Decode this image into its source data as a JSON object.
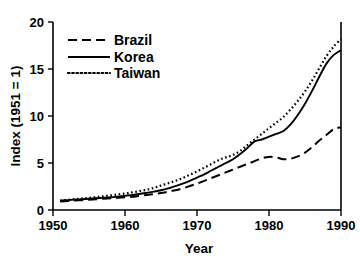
{
  "chart_data": {
    "type": "line",
    "title": "",
    "xlabel": "Year",
    "ylabel": "Index (1951 = 1)",
    "xlim": [
      1950,
      1990
    ],
    "ylim": [
      0,
      20
    ],
    "xticks": [
      1950,
      1960,
      1970,
      1980,
      1990
    ],
    "yticks": [
      0,
      5,
      10,
      15,
      20
    ],
    "grid": false,
    "legend_position": "upper left",
    "x": [
      1951,
      1952,
      1953,
      1954,
      1955,
      1956,
      1957,
      1958,
      1959,
      1960,
      1961,
      1962,
      1963,
      1964,
      1965,
      1966,
      1967,
      1968,
      1969,
      1970,
      1971,
      1972,
      1973,
      1974,
      1975,
      1976,
      1977,
      1978,
      1979,
      1980,
      1981,
      1982,
      1983,
      1984,
      1985,
      1986,
      1987,
      1988,
      1989,
      1990
    ],
    "series": [
      {
        "name": "Brazil",
        "style": "dashed",
        "color": "#000000",
        "values": [
          0.9,
          0.95,
          1.0,
          1.05,
          1.1,
          1.15,
          1.2,
          1.25,
          1.3,
          1.35,
          1.4,
          1.5,
          1.6,
          1.7,
          1.8,
          1.95,
          2.1,
          2.3,
          2.55,
          2.8,
          3.1,
          3.4,
          3.7,
          4.0,
          4.3,
          4.6,
          4.9,
          5.2,
          5.5,
          5.65,
          5.6,
          5.4,
          5.45,
          5.7,
          6.1,
          6.7,
          7.4,
          8.0,
          8.6,
          8.8
        ]
      },
      {
        "name": "Korea",
        "style": "solid",
        "color": "#000000",
        "values": [
          1.0,
          1.05,
          1.1,
          1.15,
          1.2,
          1.25,
          1.3,
          1.35,
          1.42,
          1.5,
          1.6,
          1.7,
          1.82,
          1.95,
          2.1,
          2.3,
          2.55,
          2.8,
          3.1,
          3.45,
          3.8,
          4.2,
          4.6,
          5.0,
          5.4,
          5.95,
          6.6,
          7.3,
          7.5,
          7.8,
          8.1,
          8.4,
          9.1,
          10.1,
          11.3,
          12.7,
          14.2,
          15.6,
          16.5,
          17.0
        ]
      },
      {
        "name": "Taiwan",
        "style": "dotted",
        "color": "#000000",
        "values": [
          1.0,
          1.08,
          1.15,
          1.22,
          1.3,
          1.38,
          1.46,
          1.55,
          1.65,
          1.75,
          1.88,
          2.0,
          2.15,
          2.35,
          2.6,
          2.85,
          3.1,
          3.4,
          3.75,
          4.1,
          4.5,
          4.9,
          5.3,
          5.6,
          5.85,
          6.3,
          6.9,
          7.5,
          8.1,
          8.7,
          9.3,
          9.9,
          10.7,
          11.6,
          12.6,
          13.8,
          15.1,
          16.4,
          17.4,
          18.2
        ]
      }
    ],
    "legend": [
      {
        "label": "Brazil",
        "style": "dashed"
      },
      {
        "label": "Korea",
        "style": "solid"
      },
      {
        "label": "Taiwan",
        "style": "dotted"
      }
    ]
  }
}
